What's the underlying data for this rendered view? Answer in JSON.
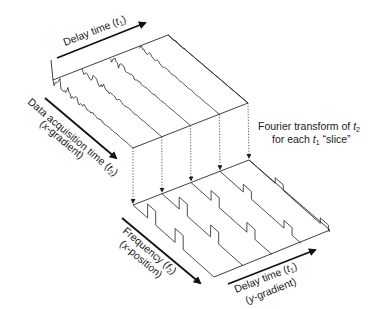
{
  "labels": {
    "delay_top": {
      "text": "Delay time (",
      "var": "t",
      "sub": "1",
      "close": ")"
    },
    "acq_line1": {
      "text": "Data acquisition time (",
      "var": "t",
      "sub": "2",
      "close": ")"
    },
    "acq_line2": {
      "pre": "(",
      "var": "x",
      "post": "-gradient)"
    },
    "ft_line1": {
      "text": "Fourier transform of ",
      "var": "t",
      "sub": "2"
    },
    "ft_line2": {
      "pre": "for each ",
      "var": "t",
      "sub": "1",
      "post": " “slice”"
    },
    "freq_line1": {
      "text": "Frequency (",
      "var": "f",
      "sub": "2",
      "close": ")"
    },
    "freq_line2": {
      "pre": "(",
      "var": "x",
      "post": "-position)"
    },
    "delay_bottom_line1": {
      "text": "Delay time (",
      "var": "t",
      "sub": "1",
      "close": ")"
    },
    "delay_bottom_line2": {
      "pre": "(",
      "var": "y",
      "post": "-gradient)"
    }
  },
  "diagram": {
    "slice_count": 5,
    "upper_plane": "time-domain FID signals (t2) for each t1 slice",
    "lower_plane": "frequency-domain spectra (f2) for each t1 slice",
    "colors": {
      "ink": "#1a1a1a",
      "background": "#ffffff"
    }
  }
}
